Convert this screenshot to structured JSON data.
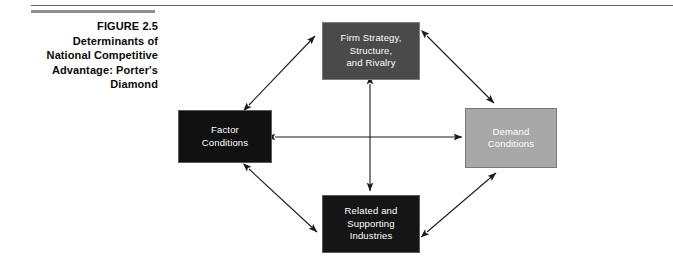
{
  "figure": {
    "caption_lines": [
      "FIGURE 2.5",
      "Determinants of",
      "National Competitive",
      "Advantage: Porter's",
      "Diamond"
    ]
  },
  "diagram": {
    "type": "diamond-framework",
    "nodes": [
      {
        "id": "firm-strategy",
        "lines": [
          "Firm Strategy,",
          "Structure,",
          "and Rivalry"
        ],
        "fill": "#4a4a4a",
        "text_color": "#ffffff",
        "position": "top"
      },
      {
        "id": "factor-conditions",
        "lines": [
          "Factor",
          "Conditions"
        ],
        "fill": "#111111",
        "text_color": "#ffffff",
        "position": "left"
      },
      {
        "id": "demand-conditions",
        "lines": [
          "Demand",
          "Conditions"
        ],
        "fill": "#a8a8a8",
        "text_color": "#ffffff",
        "position": "right"
      },
      {
        "id": "related-supporting",
        "lines": [
          "Related and",
          "Supporting",
          "Industries"
        ],
        "fill": "#151515",
        "text_color": "#ffffff",
        "position": "bottom"
      }
    ],
    "connectors": [
      {
        "id": "factor-to-firm",
        "from": "factor-conditions",
        "to": "firm-strategy",
        "style": "double-arrow"
      },
      {
        "id": "firm-to-demand",
        "from": "firm-strategy",
        "to": "demand-conditions",
        "style": "double-arrow"
      },
      {
        "id": "factor-to-related",
        "from": "factor-conditions",
        "to": "related-supporting",
        "style": "double-arrow"
      },
      {
        "id": "related-to-demand",
        "from": "related-supporting",
        "to": "demand-conditions",
        "style": "double-arrow"
      },
      {
        "id": "factor-to-demand",
        "from": "factor-conditions",
        "to": "demand-conditions",
        "style": "double-arrow"
      },
      {
        "id": "firm-to-related",
        "from": "firm-strategy",
        "to": "related-supporting",
        "style": "double-arrow"
      }
    ],
    "line_color": "#1a1a1a",
    "background": "#ffffff"
  },
  "rules": {
    "top_rule_color": "#5d5d5d",
    "caption_rule_color": "#8e8e8e"
  }
}
